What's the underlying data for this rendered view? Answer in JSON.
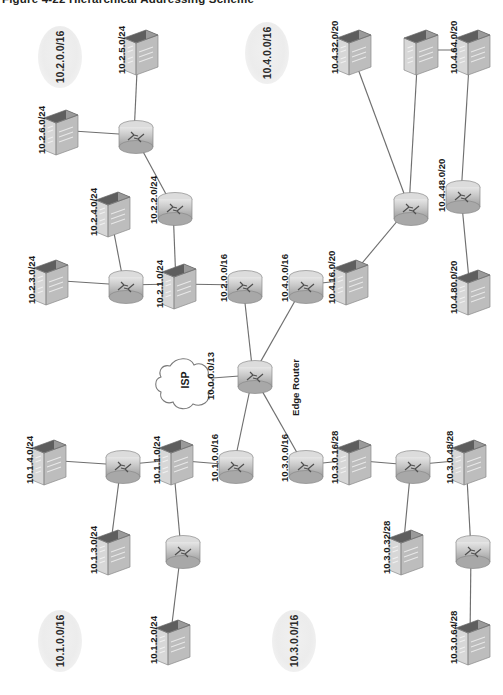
{
  "figure": {
    "title": "Figure 4-22   Hierarchical Addressing Scheme",
    "type": "network-topology-diagram",
    "orientation": "rotated-90-ccw-labels"
  },
  "cloud": {
    "name": "ISP",
    "link_label": "10.0.0.0/13"
  },
  "core": {
    "edge_router_label": "Edge Router"
  },
  "zones": [
    {
      "id": "zone-10-2",
      "label": "10.2.0.0/16",
      "x": 38,
      "y": 26,
      "w": 44,
      "h": 62
    },
    {
      "id": "zone-10-4",
      "label": "10.4.0.0/16",
      "x": 245,
      "y": 22,
      "w": 44,
      "h": 62
    },
    {
      "id": "zone-10-1",
      "label": "10.1.0.0/16",
      "x": 38,
      "y": 610,
      "w": 44,
      "h": 62
    },
    {
      "id": "zone-10-3",
      "label": "10.3.0.0/16",
      "x": 272,
      "y": 610,
      "w": 44,
      "h": 62
    }
  ],
  "nodes": [
    {
      "id": "sw-10-2-5",
      "kind": "switch",
      "label": "10.2.5.0/24",
      "x": 120,
      "y": 28
    },
    {
      "id": "sw-10-2-6",
      "kind": "switch",
      "label": "10.2.6.0/24",
      "x": 40,
      "y": 108
    },
    {
      "id": "rt-10-2-a",
      "kind": "router",
      "label": "",
      "x": 113,
      "y": 118
    },
    {
      "id": "rt-10-2-b",
      "kind": "router",
      "label": "10.2.2.0/24",
      "x": 152,
      "y": 190
    },
    {
      "id": "sw-10-2-4",
      "kind": "switch",
      "label": "10.2.4.0/24",
      "x": 92,
      "y": 190
    },
    {
      "id": "sw-10-2-3",
      "kind": "switch",
      "label": "10.2.3.0/24",
      "x": 30,
      "y": 258
    },
    {
      "id": "rt-10-2-c",
      "kind": "router",
      "label": "",
      "x": 103,
      "y": 268
    },
    {
      "id": "sw-10-2-1",
      "kind": "switch",
      "label": "10.2.1.0/24",
      "x": 158,
      "y": 262
    },
    {
      "id": "rt-10-2-0",
      "kind": "router",
      "label": "10.2.0.0/16",
      "x": 222,
      "y": 268
    },
    {
      "id": "rt-10-4-0",
      "kind": "router",
      "label": "10.4.0.0/16",
      "x": 283,
      "y": 268
    },
    {
      "id": "sw-10-4-16",
      "kind": "switch",
      "label": "10.4.16.0/20",
      "x": 330,
      "y": 258
    },
    {
      "id": "rt-10-4-a",
      "kind": "router",
      "label": "",
      "x": 388,
      "y": 190
    },
    {
      "id": "sw-10-4-32",
      "kind": "switch",
      "label": "10.4.32.0/20",
      "x": 333,
      "y": 28
    },
    {
      "id": "sw-10-4-mid",
      "kind": "switch",
      "label": "",
      "x": 400,
      "y": 28
    },
    {
      "id": "sw-10-4-64",
      "kind": "switch",
      "label": "10.4.64.0/20",
      "x": 452,
      "y": 28
    },
    {
      "id": "rt-10-4-b",
      "kind": "router",
      "label": "10.4.48.0/20",
      "x": 440,
      "y": 178
    },
    {
      "id": "sw-10-4-80",
      "kind": "switch",
      "label": "10.4.80.0/20",
      "x": 452,
      "y": 268
    },
    {
      "id": "rt-edge",
      "kind": "router",
      "label": "Edge Router",
      "x": 232,
      "y": 358
    },
    {
      "id": "sw-10-1-4",
      "kind": "switch",
      "label": "10.1.4.0/24",
      "x": 28,
      "y": 438
    },
    {
      "id": "rt-10-1-a",
      "kind": "router",
      "label": "",
      "x": 100,
      "y": 448
    },
    {
      "id": "sw-10-1-1",
      "kind": "switch",
      "label": "10.1.1.0/24",
      "x": 155,
      "y": 438
    },
    {
      "id": "sw-10-1-3",
      "kind": "switch",
      "label": "10.1.3.0/24",
      "x": 92,
      "y": 528
    },
    {
      "id": "rt-10-1-0",
      "kind": "router",
      "label": "10.1.0.0/16",
      "x": 213,
      "y": 448
    },
    {
      "id": "rt-10-1-b",
      "kind": "router",
      "label": "",
      "x": 160,
      "y": 533
    },
    {
      "id": "sw-10-1-2",
      "kind": "switch",
      "label": "10.1.2.0/24",
      "x": 152,
      "y": 618
    },
    {
      "id": "rt-10-3-0",
      "kind": "router",
      "label": "10.3.0.0/16",
      "x": 283,
      "y": 448
    },
    {
      "id": "sw-10-3-16",
      "kind": "switch",
      "label": "10.3.0.16/28",
      "x": 333,
      "y": 438
    },
    {
      "id": "rt-10-3-a",
      "kind": "router",
      "label": "",
      "x": 390,
      "y": 448
    },
    {
      "id": "sw-10-3-32",
      "kind": "switch",
      "label": "10.3.0.32/28",
      "x": 385,
      "y": 528
    },
    {
      "id": "sw-10-3-48",
      "kind": "switch",
      "label": "10.3.0.48/28",
      "x": 448,
      "y": 438
    },
    {
      "id": "rt-10-3-b",
      "kind": "router",
      "label": "",
      "x": 450,
      "y": 533
    },
    {
      "id": "sw-10-3-64",
      "kind": "switch",
      "label": "10.3.0.64/28",
      "x": 452,
      "y": 618
    }
  ],
  "links": [
    [
      "sw-10-2-5",
      "rt-10-2-a"
    ],
    [
      "sw-10-2-6",
      "rt-10-2-a"
    ],
    [
      "rt-10-2-a",
      "rt-10-2-b"
    ],
    [
      "rt-10-2-b",
      "sw-10-2-1"
    ],
    [
      "sw-10-2-4",
      "rt-10-2-c"
    ],
    [
      "sw-10-2-3",
      "rt-10-2-c"
    ],
    [
      "rt-10-2-c",
      "sw-10-2-1"
    ],
    [
      "sw-10-2-1",
      "rt-10-2-0"
    ],
    [
      "rt-10-2-0",
      "rt-edge"
    ],
    [
      "rt-10-4-0",
      "rt-edge"
    ],
    [
      "rt-10-4-0",
      "sw-10-4-16"
    ],
    [
      "sw-10-4-16",
      "rt-10-4-a"
    ],
    [
      "rt-10-4-a",
      "sw-10-4-32"
    ],
    [
      "rt-10-4-a",
      "sw-10-4-mid"
    ],
    [
      "sw-10-4-mid",
      "sw-10-4-64"
    ],
    [
      "sw-10-4-64",
      "rt-10-4-b"
    ],
    [
      "rt-10-4-b",
      "sw-10-4-80"
    ],
    [
      "rt-edge",
      "rt-10-1-0"
    ],
    [
      "rt-10-1-0",
      "sw-10-1-1"
    ],
    [
      "sw-10-1-1",
      "rt-10-1-a"
    ],
    [
      "rt-10-1-a",
      "sw-10-1-4"
    ],
    [
      "rt-10-1-a",
      "sw-10-1-3"
    ],
    [
      "sw-10-1-1",
      "rt-10-1-b"
    ],
    [
      "rt-10-1-b",
      "sw-10-1-2"
    ],
    [
      "rt-edge",
      "rt-10-3-0"
    ],
    [
      "rt-10-3-0",
      "sw-10-3-16"
    ],
    [
      "sw-10-3-16",
      "rt-10-3-a"
    ],
    [
      "rt-10-3-a",
      "sw-10-3-32"
    ],
    [
      "rt-10-3-a",
      "sw-10-3-48"
    ],
    [
      "sw-10-3-48",
      "rt-10-3-b"
    ],
    [
      "rt-10-3-b",
      "sw-10-3-64"
    ],
    [
      "cloud",
      "rt-edge"
    ]
  ],
  "colors": {
    "link": "#6f6f6f",
    "device_light": "#e2e2e2",
    "device_mid": "#b9b9b9",
    "device_dark": "#8f8f8f",
    "device_top": "#6b6b6b",
    "text": "#1b1b1b",
    "zone_fill": "#eeeeee"
  }
}
